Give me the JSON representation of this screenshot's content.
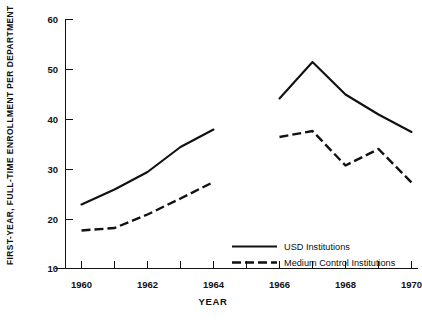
{
  "chart_data": {
    "type": "line",
    "title": "",
    "xlabel": "YEAR",
    "ylabel": "FIRST-YEAR, FULL-TIME ENROLLMENT PER DEPARTMENT",
    "x": [
      1960,
      1961,
      1962,
      1963,
      1964,
      1965,
      1966,
      1967,
      1968,
      1969,
      1970
    ],
    "xlim": [
      1960,
      1970
    ],
    "ylim": [
      10,
      60
    ],
    "xticks": [
      1960,
      1961,
      1962,
      1963,
      1964,
      1965,
      1966,
      1967,
      1968,
      1969,
      1970
    ],
    "xticklabels": [
      "1960",
      "",
      "1962",
      "",
      "1964",
      "",
      "1966",
      "",
      "1968",
      "",
      "1970"
    ],
    "yticks": [
      10,
      20,
      30,
      40,
      50,
      60
    ],
    "yticklabels": [
      "10",
      "20",
      "30",
      "40",
      "50",
      "60"
    ],
    "grid": false,
    "legend_position": "lower right",
    "series": [
      {
        "name": "USD Institutions",
        "style": "solid",
        "color": "#111111",
        "points": [
          {
            "x": 1960,
            "y": 23.0
          },
          {
            "x": 1961,
            "y": 26.0
          },
          {
            "x": 1962,
            "y": 29.5
          },
          {
            "x": 1963,
            "y": 34.5
          },
          {
            "x": 1964,
            "y": 38.0
          }
        ],
        "points_second_segment": [
          {
            "x": 1966,
            "y": 44.2
          },
          {
            "x": 1967,
            "y": 51.5
          },
          {
            "x": 1968,
            "y": 45.0
          },
          {
            "x": 1969,
            "y": 41.0
          },
          {
            "x": 1970,
            "y": 37.5
          }
        ]
      },
      {
        "name": "Medium Control Institutions",
        "style": "dashed",
        "color": "#111111",
        "points": [
          {
            "x": 1960,
            "y": 17.8
          },
          {
            "x": 1961,
            "y": 18.3
          },
          {
            "x": 1962,
            "y": 21.0
          },
          {
            "x": 1963,
            "y": 24.2
          },
          {
            "x": 1964,
            "y": 27.5
          }
        ],
        "points_second_segment": [
          {
            "x": 1966,
            "y": 36.5
          },
          {
            "x": 1967,
            "y": 37.7
          },
          {
            "x": 1968,
            "y": 30.8
          },
          {
            "x": 1969,
            "y": 34.1
          },
          {
            "x": 1970,
            "y": 27.4
          }
        ]
      }
    ],
    "legend": [
      {
        "label": "USD Institutions",
        "style": "solid"
      },
      {
        "label": "Medium Control Institutions",
        "style": "dashed"
      }
    ]
  }
}
